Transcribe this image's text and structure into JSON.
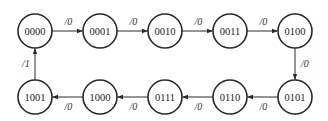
{
  "diagram": {
    "type": "state-transition",
    "states": [
      {
        "id": "s0",
        "label": "0000",
        "cx": 35,
        "cy": 31
      },
      {
        "id": "s1",
        "label": "0001",
        "cx": 100,
        "cy": 31
      },
      {
        "id": "s2",
        "label": "0010",
        "cx": 165,
        "cy": 31
      },
      {
        "id": "s3",
        "label": "0011",
        "cx": 230,
        "cy": 31
      },
      {
        "id": "s4",
        "label": "0100",
        "cx": 295,
        "cy": 31
      },
      {
        "id": "s5",
        "label": "0101",
        "cx": 295,
        "cy": 97
      },
      {
        "id": "s6",
        "label": "0110",
        "cx": 230,
        "cy": 97
      },
      {
        "id": "s7",
        "label": "0111",
        "cx": 165,
        "cy": 97
      },
      {
        "id": "s8",
        "label": "1000",
        "cx": 100,
        "cy": 97
      },
      {
        "id": "s9",
        "label": "1001",
        "cx": 35,
        "cy": 97
      }
    ],
    "transitions": [
      {
        "from": "s0",
        "to": "s1",
        "label": "/0"
      },
      {
        "from": "s1",
        "to": "s2",
        "label": "/0"
      },
      {
        "from": "s2",
        "to": "s3",
        "label": "/0"
      },
      {
        "from": "s3",
        "to": "s4",
        "label": "/0"
      },
      {
        "from": "s4",
        "to": "s5",
        "label": "/0"
      },
      {
        "from": "s5",
        "to": "s6",
        "label": "/0"
      },
      {
        "from": "s6",
        "to": "s7",
        "label": "/0"
      },
      {
        "from": "s7",
        "to": "s8",
        "label": "/0"
      },
      {
        "from": "s8",
        "to": "s9",
        "label": "/0"
      },
      {
        "from": "s9",
        "to": "s0",
        "label": "/1"
      }
    ],
    "radius": 17,
    "stroke_color": "#2a2a2a",
    "background": "#ffffff"
  }
}
